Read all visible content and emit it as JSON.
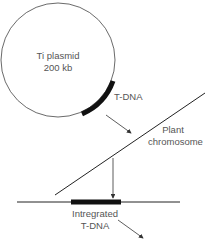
{
  "diagram": {
    "plasmid": {
      "name": "Ti plasmid",
      "size": "200 kb"
    },
    "tdna_label": "T-DNA",
    "chromosome": {
      "line1": "Plant",
      "line2": "chromosome"
    },
    "integrated": {
      "line1": "Intregrated",
      "line2": "T-DNA"
    }
  }
}
